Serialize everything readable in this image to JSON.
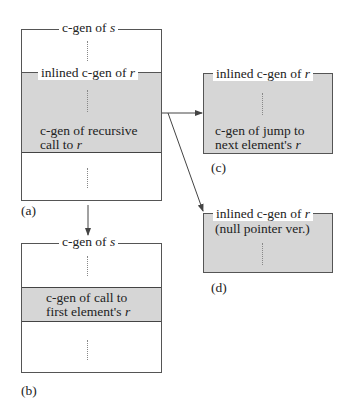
{
  "figure": {
    "panel_a": {
      "label": "(a)",
      "outer_title_prefix": "c-gen of ",
      "outer_title_var": "s",
      "inner_title_prefix": "inlined c-gen of ",
      "inner_title_var": "r",
      "inner_body_line1": "c-gen of recursive",
      "inner_body_line2_prefix": "call to ",
      "inner_body_line2_var": "r"
    },
    "panel_b": {
      "label": "(b)",
      "outer_title_prefix": "c-gen of ",
      "outer_title_var": "s",
      "body_line1": "c-gen of call to",
      "body_line2_prefix": "first element's ",
      "body_line2_var": "r"
    },
    "panel_c": {
      "label": "(c)",
      "title_prefix": "inlined c-gen of ",
      "title_var": "r",
      "body_line1": "c-gen of jump to",
      "body_line2_prefix": "next element's ",
      "body_line2_var": "r"
    },
    "panel_d": {
      "label": "(d)",
      "title_prefix": "inlined c-gen of ",
      "title_var": "r",
      "subtitle": "(null pointer ver.)"
    },
    "colors": {
      "shade": "#d6d6d6",
      "line": "#444444"
    }
  }
}
